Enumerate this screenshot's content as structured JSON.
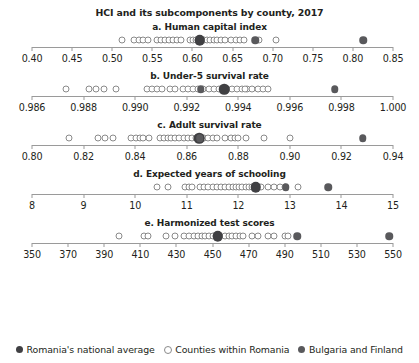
{
  "chart_title": "HCI and its subcomponents by county, 2017",
  "legend": {
    "position": "bottom-center",
    "items": [
      {
        "key": "national",
        "label": "Romania's national average",
        "marker": "filled-large-dot",
        "color": "#404043"
      },
      {
        "key": "county",
        "label": "Counties within Romania",
        "marker": "hollow-dot",
        "color": "#ffffff"
      },
      {
        "key": "compare",
        "label": "Bulgaria and Finland",
        "marker": "filled-dot",
        "color": "#59595c"
      }
    ]
  },
  "chart_data": {
    "type": "scatter",
    "title": "HCI and its subcomponents by county, 2017",
    "xlabel": "",
    "ylabel": "",
    "grid": false,
    "legend_position": "bottom",
    "panels": [
      {
        "id": "a",
        "title": "a. Human capital index",
        "xlim": [
          0.4,
          0.85
        ],
        "ticks": [
          0.4,
          0.45,
          0.5,
          0.55,
          0.6,
          0.65,
          0.7,
          0.75,
          0.8,
          0.85
        ],
        "ticklabels": [
          "0.40",
          "0.45",
          "0.50",
          "0.55",
          "0.60",
          "0.65",
          "0.70",
          "0.75",
          "0.80",
          "0.85"
        ],
        "series": [
          {
            "name": "Counties within Romania",
            "class": "county",
            "values": [
              0.512,
              0.527,
              0.533,
              0.538,
              0.544,
              0.556,
              0.561,
              0.566,
              0.571,
              0.576,
              0.581,
              0.586,
              0.597,
              0.601,
              0.604,
              0.607,
              0.614,
              0.618,
              0.622,
              0.627,
              0.631,
              0.636,
              0.641,
              0.648,
              0.654,
              0.659,
              0.664,
              0.683,
              0.704
            ]
          },
          {
            "name": "Romania's national average",
            "class": "national",
            "values": [
              0.609
            ]
          },
          {
            "name": "Bulgaria and Finland",
            "class": "compare",
            "values": [
              0.678,
              0.813
            ]
          }
        ]
      },
      {
        "id": "b",
        "title": "b. Under-5 survival rate",
        "xlim": [
          0.986,
          1.0
        ],
        "ticks": [
          0.986,
          0.988,
          0.99,
          0.992,
          0.994,
          0.996,
          0.998,
          1.0
        ],
        "ticklabels": [
          "0.986",
          "0.988",
          "0.990",
          "0.992",
          "0.994",
          "0.996",
          "0.998",
          "1.000"
        ],
        "series": [
          {
            "name": "Counties within Romania",
            "class": "county",
            "values": [
              0.9873,
              0.9882,
              0.9885,
              0.9888,
              0.98925,
              0.99045,
              0.99065,
              0.99085,
              0.99105,
              0.99135,
              0.99155,
              0.99185,
              0.99205,
              0.99225,
              0.99245,
              0.99265,
              0.99285,
              0.99305,
              0.99325,
              0.99355,
              0.99375,
              0.99395,
              0.99415,
              0.99435,
              0.99455,
              0.99475,
              0.99495,
              0.99425,
              0.99515
            ]
          },
          {
            "name": "Romania's national average",
            "class": "national",
            "values": [
              0.99345
            ]
          },
          {
            "name": "Bulgaria and Finland",
            "class": "compare",
            "values": [
              0.99255,
              0.99775
            ]
          }
        ]
      },
      {
        "id": "c",
        "title": "c. Adult survival rate",
        "xlim": [
          0.8,
          0.94
        ],
        "ticks": [
          0.8,
          0.82,
          0.84,
          0.86,
          0.88,
          0.9,
          0.92,
          0.94
        ],
        "ticklabels": [
          "0.80",
          "0.82",
          "0.84",
          "0.86",
          "0.88",
          "0.90",
          "0.92",
          "0.94"
        ],
        "series": [
          {
            "name": "Counties within Romania",
            "class": "county",
            "values": [
              0.8145,
              0.8255,
              0.8285,
              0.8315,
              0.8385,
              0.8405,
              0.8418,
              0.8432,
              0.8455,
              0.8495,
              0.8512,
              0.8526,
              0.854,
              0.8556,
              0.8572,
              0.8588,
              0.8604,
              0.862,
              0.8636,
              0.8668,
              0.8684,
              0.87,
              0.8716,
              0.8748,
              0.8772,
              0.8786,
              0.88,
              0.8828,
              0.8898,
              0.9
            ]
          },
          {
            "name": "Romania's national average",
            "class": "national",
            "values": [
              0.8648
            ]
          },
          {
            "name": "Bulgaria and Finland",
            "class": "compare",
            "values": [
              0.865,
              0.9282
            ]
          }
        ]
      },
      {
        "id": "d",
        "title": "d. Expected years of schooling",
        "xlim": [
          8,
          15
        ],
        "ticks": [
          8,
          9,
          10,
          11,
          12,
          13,
          14,
          15
        ],
        "ticklabels": [
          "8",
          "9",
          "10",
          "11",
          "12",
          "13",
          "14",
          "15"
        ],
        "series": [
          {
            "name": "Counties within Romania",
            "class": "county",
            "values": [
              10.43,
              10.64,
              10.96,
              11.04,
              11.1,
              11.25,
              11.34,
              11.42,
              11.5,
              11.58,
              11.66,
              11.74,
              11.82,
              11.9,
              11.96,
              12.02,
              12.08,
              12.14,
              12.2,
              12.26,
              12.45,
              12.58,
              12.7,
              12.8,
              12.9,
              13.15
            ]
          },
          {
            "name": "Romania's national average",
            "class": "national",
            "values": [
              12.34
            ]
          },
          {
            "name": "Bulgaria and Finland",
            "class": "compare",
            "values": [
              12.92,
              13.74
            ]
          }
        ]
      },
      {
        "id": "e",
        "title": "e. Harmonized test scores",
        "xlim": [
          350,
          550
        ],
        "ticks": [
          350,
          370,
          390,
          410,
          430,
          450,
          470,
          490,
          510,
          530,
          550
        ],
        "ticklabels": [
          "350",
          "370",
          "390",
          "410",
          "430",
          "450",
          "470",
          "490",
          "510",
          "530",
          "550"
        ],
        "series": [
          {
            "name": "Counties within Romania",
            "class": "county",
            "values": [
              398,
              412,
              414,
              424,
              429,
              434,
              437,
              440,
              442,
              444,
              446,
              448,
              450,
              452,
              457,
              459,
              461,
              463,
              465,
              467,
              472,
              475,
              481,
              484,
              490,
              492
            ]
          },
          {
            "name": "Romania's national average",
            "class": "national",
            "values": [
              453
            ]
          },
          {
            "name": "Bulgaria and Finland",
            "class": "compare",
            "values": [
              497,
              548
            ]
          }
        ]
      }
    ]
  }
}
